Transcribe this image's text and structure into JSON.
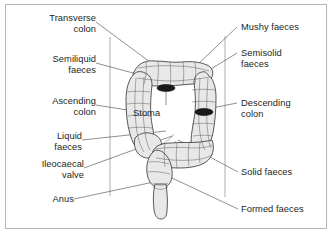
{
  "figure": {
    "background": "#ffffff",
    "border_color": "#b6b6b6",
    "text_color": "#231f20",
    "organ_fill": "#e8e8e8",
    "organ_outline": "#3b3b3b",
    "stoma_color": "#1a1a1a"
  },
  "labels_left": [
    {
      "id": "transverse-colon",
      "text": "Transverse\ncolon"
    },
    {
      "id": "semiliquid-faeces",
      "text": "Semiliquid\nfaeces"
    },
    {
      "id": "ascending-colon",
      "text": "Ascending\ncolon"
    },
    {
      "id": "liquid-faeces",
      "text": "Liquid\nfaeces"
    },
    {
      "id": "ileocaecal-valve",
      "text": "Ileocaecal\nvalve"
    },
    {
      "id": "anus",
      "text": "Anus"
    }
  ],
  "labels_right": [
    {
      "id": "mushy-faeces",
      "text": "Mushy faeces"
    },
    {
      "id": "semisolid-faeces",
      "text": "Semisolid\nfaeces"
    },
    {
      "id": "descending-colon",
      "text": "Descending\ncolon"
    },
    {
      "id": "solid-faeces",
      "text": "Solid faeces"
    },
    {
      "id": "formed-faeces",
      "text": "Formed faeces"
    }
  ],
  "labels_center": [
    {
      "id": "stoma",
      "text": "Stoma"
    }
  ]
}
